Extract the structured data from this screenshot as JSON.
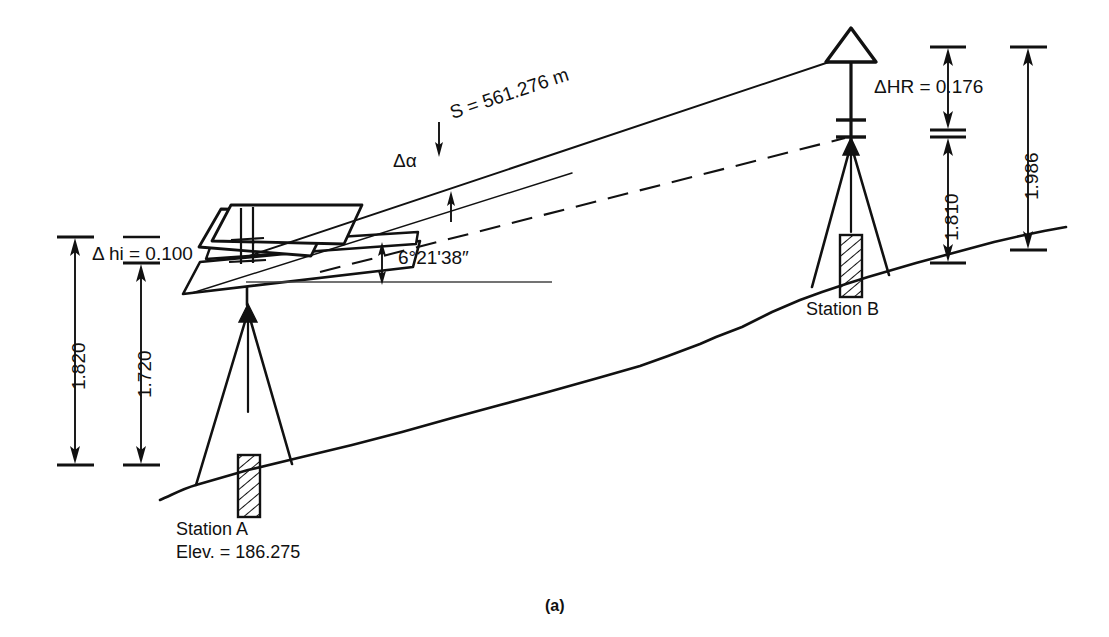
{
  "figure": {
    "caption": "(a)",
    "title_alt": "Total station setup: slope distance and elevation difference between Station A and Station B"
  },
  "labels": {
    "delta_hi": "Δ hi = 0.100",
    "hi_total": "1.820",
    "hi_instrument": "1.720",
    "slope_distance": "S = 561.276 m",
    "delta_alpha": "Δα",
    "vertical_angle": "6°21'38″",
    "delta_hr": "ΔHR = 0.176",
    "hr_reflector": "1.810",
    "hr_total": "1.986"
  },
  "stations": {
    "a": {
      "name": "Station A",
      "elevation": "Elev. = 186.275"
    },
    "b": {
      "name": "Station B"
    }
  },
  "colors": {
    "line": "#111111",
    "background": "#ffffff"
  },
  "icons": {
    "total_station": "total-station-icon",
    "prism_target": "prism-target-icon",
    "tripod": "tripod-icon",
    "ground_monument": "hatched-monument-icon",
    "dimension_arrow": "dimension-arrow-icon"
  }
}
